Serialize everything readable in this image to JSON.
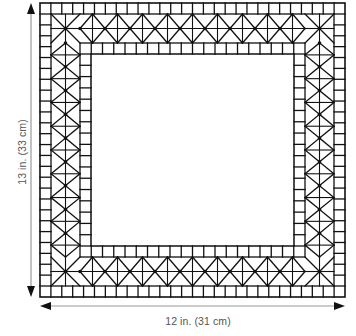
{
  "diagram": {
    "width_label": "12 in. (31 cm)",
    "height_label": "13 in. (33 cm)",
    "colors": {
      "line": "#111111",
      "arrow": "#999999",
      "arrowhead": "#111111",
      "label": "#555555",
      "background": "#ffffff"
    },
    "geometry": {
      "outer": {
        "x": 40,
        "y": 3,
        "w": 305,
        "h": 294
      },
      "outer_row_thickness": 11,
      "band_thickness": 29,
      "inner_row_thickness": 11,
      "square_tile_size": 11,
      "diamond_width": 25
    },
    "dimension_arrows": {
      "vertical": {
        "x": 31,
        "y1": 3,
        "y2": 297
      },
      "horizontal": {
        "y": 306,
        "x1": 40,
        "x2": 345
      }
    },
    "layers": [
      "outer square-tile row",
      "diamond/triangle band",
      "inner square-tile row",
      "open center"
    ]
  }
}
